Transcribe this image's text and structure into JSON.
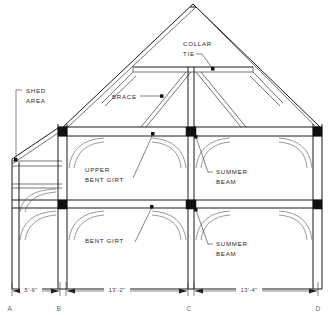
{
  "drawing": {
    "type": "timber-frame-bent-elevation",
    "title": "Timber Frame Bent Elevation",
    "annotations": [
      {
        "id": "shed-area",
        "label_line1": "SHED",
        "label_line2": "AREA",
        "x": 26,
        "y": 92,
        "leader_to_x": 14,
        "leader_to_y": 160
      },
      {
        "id": "collar-tie",
        "label_line1": "COLLAR",
        "label_line2": "TIE",
        "x": 183,
        "y": 43,
        "leader_to_x": 213,
        "leader_to_y": 69
      },
      {
        "id": "brace",
        "label_line1": "BRACE",
        "label_line2": "",
        "x": 112,
        "y": 99,
        "leader_to_x": 162,
        "leader_to_y": 98
      },
      {
        "id": "upper-bent-girt",
        "label_line1": "UPPER",
        "label_line2": "BENT GIRT",
        "x": 85,
        "y": 168,
        "leader_to_x": 153,
        "leader_to_y": 133
      },
      {
        "id": "summer-beam-upper",
        "label_line1": "SUMMER",
        "label_line2": "BEAM",
        "x": 213,
        "y": 170,
        "leader_to_x": 195,
        "leader_to_y": 136
      },
      {
        "id": "bent-girt",
        "label_line1": "BENT GIRT",
        "label_line2": "",
        "x": 85,
        "y": 238,
        "leader_to_x": 152,
        "leader_to_y": 206
      },
      {
        "id": "summer-beam-lower",
        "label_line1": "SUMMER",
        "label_line2": "BEAM",
        "x": 213,
        "y": 241,
        "leader_to_x": 195,
        "leader_to_y": 209
      }
    ],
    "dimensions": [
      {
        "id": "dim-a-b",
        "text": "5'-6\"",
        "from_grid": "A",
        "to_grid": "B",
        "x1": 12,
        "x2": 60,
        "label_x": 30,
        "label_y": 291
      },
      {
        "id": "dim-b-c",
        "text": "13'-2\"",
        "from_grid": "B",
        "to_grid": "C",
        "x1": 60,
        "x2": 190,
        "label_x": 118,
        "label_y": 291
      },
      {
        "id": "dim-c-d",
        "text": "13'-4\"",
        "from_grid": "C",
        "to_grid": "D",
        "x1": 190,
        "x2": 318,
        "label_x": 249,
        "label_y": 291
      }
    ],
    "grid_labels": [
      {
        "id": "grid-a",
        "text": "A",
        "x": 10,
        "y": 310
      },
      {
        "id": "grid-b",
        "text": "B",
        "x": 58,
        "y": 310
      },
      {
        "id": "grid-c",
        "text": "C",
        "x": 188,
        "y": 310
      },
      {
        "id": "grid-d",
        "text": "D",
        "x": 316,
        "y": 310
      }
    ],
    "colors": {
      "line": "#1a1a1a",
      "light_line": "#555555",
      "joint": "#111111",
      "text": "#2a2a2a",
      "grid_text": "#6a6a6a",
      "background": "#ffffff"
    }
  }
}
